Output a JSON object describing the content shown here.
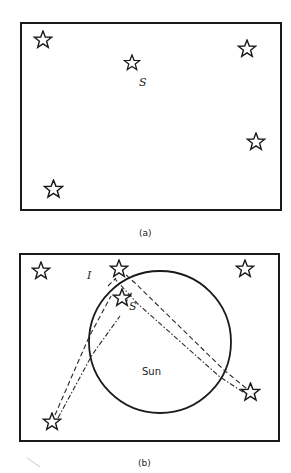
{
  "figure": {
    "panels": [
      {
        "id": "a",
        "caption": "(a)",
        "star_label": "S",
        "stars": [
          {
            "name": "star-top-left",
            "x": 43,
            "y": 40
          },
          {
            "name": "star-s",
            "x": 132,
            "y": 63
          },
          {
            "name": "star-top-right",
            "x": 247,
            "y": 49
          },
          {
            "name": "star-right",
            "x": 256,
            "y": 142
          },
          {
            "name": "star-bottom-left",
            "x": 53,
            "y": 189
          }
        ]
      },
      {
        "id": "b",
        "caption": "(b)",
        "image_label": "I",
        "star_label": "S",
        "sun_label": "Sun",
        "stars": [
          {
            "name": "star-top-left",
            "x": 41,
            "y": 271
          },
          {
            "name": "star-image-i",
            "x": 119,
            "y": 269
          },
          {
            "name": "star-top-right",
            "x": 245,
            "y": 269
          },
          {
            "name": "star-s",
            "x": 122,
            "y": 298
          },
          {
            "name": "star-right",
            "x": 250,
            "y": 393
          },
          {
            "name": "star-bottom-left",
            "x": 52,
            "y": 422
          }
        ]
      }
    ]
  }
}
